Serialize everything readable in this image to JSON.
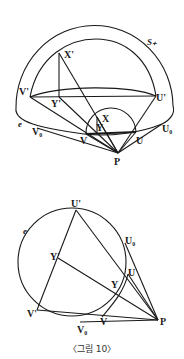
{
  "figure": {
    "caption": "〈그림 10〉"
  },
  "top_diagram": {
    "labels": {
      "S": "S₊",
      "X_prime": "X'",
      "V_prime": "V'",
      "Y_prime": "Y'",
      "U_prime": "U'",
      "e": "e",
      "V0": "V₀",
      "V": "V",
      "X": "X",
      "Y": "Y",
      "U": "U",
      "U0": "U₀",
      "P": "P"
    }
  },
  "bottom_diagram": {
    "labels": {
      "U_prime": "U'",
      "e": "e",
      "U0": "U₀",
      "Y_prime": "Y'",
      "U": "U",
      "Y": "Y",
      "V_prime": "V'",
      "V": "V",
      "V0": "V₀",
      "P": "P"
    }
  },
  "colors": {
    "stroke": "#1a1a1a",
    "background": "#ffffff"
  }
}
